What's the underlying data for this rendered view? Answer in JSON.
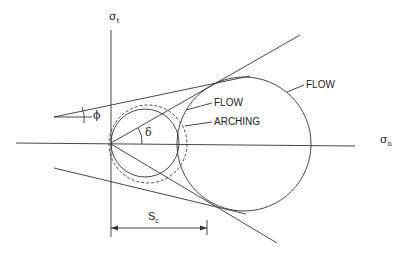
{
  "diagram": {
    "type": "Mohr circle stress diagram (flow vs arching)",
    "axes": {
      "vertical": {
        "symbol": "σ",
        "subscript": "t"
      },
      "horizontal": {
        "symbol": "σ",
        "subscript": "n"
      }
    },
    "angles": {
      "phi": "ϕ",
      "delta": "δ"
    },
    "labels": {
      "flow_large": "FLOW",
      "flow_small": "FLOW",
      "arching": "ARCHING"
    },
    "dimension": {
      "symbol": "S",
      "subscript": "c"
    },
    "colors": {
      "line": "#333333",
      "background": "#ffffff"
    }
  }
}
